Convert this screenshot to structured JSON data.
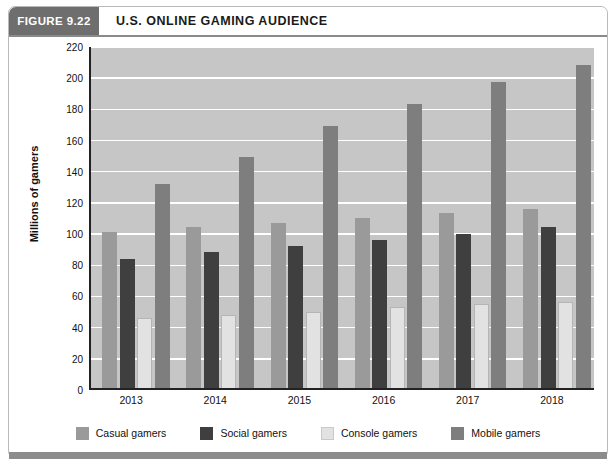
{
  "figure": {
    "tag": "FIGURE 9.22",
    "title": "U.S. ONLINE GAMING AUDIENCE"
  },
  "colors": {
    "casual": "#9a9a9a",
    "social": "#3f3f3f",
    "console": "#e2e2e2",
    "mobile": "#7e7e7e",
    "plot_background": "#c6c6c6",
    "gridline": "#ffffff",
    "axis": "#222222",
    "tag_background": "#6e6e6e",
    "bottom_bar": "#8c8c8c"
  },
  "chart_data": {
    "type": "bar",
    "title": "U.S. ONLINE GAMING AUDIENCE",
    "xlabel": "",
    "ylabel": "Millions of gamers",
    "categories": [
      "2013",
      "2014",
      "2015",
      "2016",
      "2017",
      "2018"
    ],
    "ylim": [
      0,
      220
    ],
    "yticks": [
      0,
      20,
      40,
      60,
      80,
      100,
      120,
      140,
      160,
      180,
      200,
      220
    ],
    "ytick_labels": [
      "0",
      "20",
      "40",
      "60",
      "80",
      "100",
      "120",
      "140",
      "160",
      "180",
      "200",
      "220"
    ],
    "grid": true,
    "legend_position": "bottom",
    "series": [
      {
        "name": "Casual gamers",
        "key": "casual",
        "color": "#9a9a9a",
        "values": [
          100,
          103,
          106,
          109,
          112,
          115
        ]
      },
      {
        "name": "Social gamers",
        "key": "social",
        "color": "#3f3f3f",
        "values": [
          83,
          87,
          91,
          95,
          99,
          103
        ]
      },
      {
        "name": "Console gamers",
        "key": "console",
        "color": "#e2e2e2",
        "values": [
          45,
          47,
          49,
          52,
          54,
          55
        ]
      },
      {
        "name": "Mobile gamers",
        "key": "mobile",
        "color": "#7e7e7e",
        "values": [
          131,
          148,
          168,
          182,
          196,
          207
        ]
      }
    ]
  }
}
